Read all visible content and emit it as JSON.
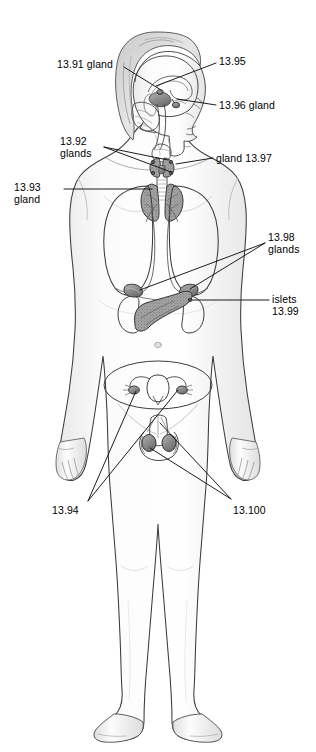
{
  "figure": {
    "background_color": "#ffffff",
    "line_color": "#1a1a1a",
    "body_fill": "#fefefe",
    "organ_shade": "#9a9a9a",
    "width": 316,
    "height": 752
  },
  "labels": [
    {
      "id": "label-13-91",
      "text": "13.91 gland",
      "lines": [
        "13.91 gland"
      ],
      "x": 57,
      "y": 59,
      "align": "left",
      "target_organ": "pineal-gland",
      "leader": {
        "x1": 124,
        "y1": 67,
        "x2": 161,
        "y2": 90
      }
    },
    {
      "id": "label-13-95",
      "text": "13.95",
      "lines": [
        "13.95"
      ],
      "x": 219,
      "y": 56,
      "align": "left",
      "target_organ": "hypothalamus",
      "leader": {
        "x1": 216,
        "y1": 63,
        "x2": 156,
        "y2": 86
      }
    },
    {
      "id": "label-13-96",
      "text": "13.96 gland",
      "lines": [
        "13.96 gland"
      ],
      "x": 219,
      "y": 100,
      "align": "left",
      "target_organ": "pituitary-gland",
      "leader": {
        "x1": 216,
        "y1": 105,
        "x2": 177,
        "y2": 98
      }
    },
    {
      "id": "label-13-92",
      "text": "13.92 glands",
      "lines": [
        "13.92",
        "glands"
      ],
      "x": 60,
      "y": 136,
      "align": "left",
      "target_organ": "parathyroid-glands",
      "leader": {
        "x1": 104,
        "y1": 148,
        "x2": 166,
        "y2": 158
      },
      "leader2": {
        "x1": 104,
        "y1": 148,
        "x2": 170,
        "y2": 170
      }
    },
    {
      "id": "label-13-97",
      "text": "gland 13.97",
      "lines": [
        "gland 13.97"
      ],
      "x": 216,
      "y": 153,
      "align": "left",
      "target_organ": "thyroid-gland",
      "leader": {
        "x1": 213,
        "y1": 158,
        "x2": 176,
        "y2": 163
      }
    },
    {
      "id": "label-13-93",
      "text": "13.93 gland",
      "lines": [
        "13.93",
        "gland"
      ],
      "x": 14,
      "y": 182,
      "align": "left",
      "target_organ": "thymus-gland",
      "leader": {
        "x1": 64,
        "y1": 189,
        "x2": 152,
        "y2": 189
      }
    },
    {
      "id": "label-13-98",
      "text": "13.98 glands",
      "lines": [
        "13.98",
        "glands"
      ],
      "x": 268,
      "y": 232,
      "align": "left",
      "target_organ": "adrenal-glands",
      "leader": {
        "x1": 265,
        "y1": 243,
        "x2": 151,
        "y2": 289
      },
      "leader2": {
        "x1": 265,
        "y1": 243,
        "x2": 184,
        "y2": 287
      }
    },
    {
      "id": "label-13-99",
      "text": "islets 13.99",
      "lines": [
        "islets",
        "13.99"
      ],
      "x": 272,
      "y": 294,
      "align": "left",
      "target_organ": "pancreatic-islets",
      "leader": {
        "x1": 269,
        "y1": 300,
        "x2": 196,
        "y2": 300
      }
    },
    {
      "id": "label-13-94",
      "text": "13.94",
      "lines": [
        "13.94"
      ],
      "x": 52,
      "y": 505,
      "align": "left",
      "target_organ": "ovaries",
      "leader": {
        "x1": 88,
        "y1": 501,
        "x2": 140,
        "y2": 390
      },
      "leader2": {
        "x1": 88,
        "y1": 501,
        "x2": 174,
        "y2": 388
      }
    },
    {
      "id": "label-13-100",
      "text": "13.100",
      "lines": [
        "13.100"
      ],
      "x": 233,
      "y": 505,
      "align": "left",
      "target_organ": "testes",
      "leader": {
        "x1": 231,
        "y1": 499,
        "x2": 149,
        "y2": 440
      },
      "leader2": {
        "x1": 231,
        "y1": 499,
        "x2": 160,
        "y2": 424
      }
    }
  ],
  "organs": [
    {
      "name": "brain",
      "label_ref": "13.91 / 13.95 / 13.96"
    },
    {
      "name": "thyroid-gland",
      "label_ref": "gland 13.97"
    },
    {
      "name": "parathyroid-glands",
      "label_ref": "13.92 glands"
    },
    {
      "name": "thymus-gland",
      "label_ref": "13.93 gland"
    },
    {
      "name": "lungs",
      "label_ref": ""
    },
    {
      "name": "adrenal-glands",
      "label_ref": "13.98 glands"
    },
    {
      "name": "pancreas",
      "label_ref": "islets 13.99"
    },
    {
      "name": "kidneys",
      "label_ref": ""
    },
    {
      "name": "uterus-ovaries",
      "label_ref": "13.94"
    },
    {
      "name": "testes",
      "label_ref": "13.100"
    }
  ]
}
